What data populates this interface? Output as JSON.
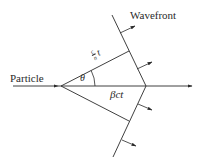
{
  "diagram": {
    "labels": {
      "particle": "Particle",
      "wavefront": "Wavefront",
      "angle": "θ",
      "distance_particle": "βct",
      "distance_light_num": "c",
      "distance_light_den": "n",
      "distance_light_var": "t"
    },
    "colors": {
      "line": "#2a2a2a",
      "background": "#ffffff"
    }
  }
}
